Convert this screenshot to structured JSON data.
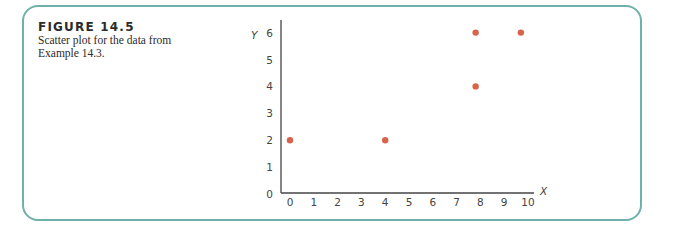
{
  "figure": {
    "title": "FIGURE 14.5",
    "caption": "Scatter plot for the data from Example 14.3.",
    "frame_color": "#6fb1aa",
    "point_color": "#d9634a"
  },
  "chart_data": {
    "type": "scatter",
    "title": "",
    "xlabel": "X",
    "ylabel": "Y",
    "xlim": [
      0,
      10
    ],
    "ylim": [
      0,
      6
    ],
    "x_ticks": [
      "0",
      "1",
      "2",
      "3",
      "4",
      "5",
      "6",
      "7",
      "8",
      "9",
      "10"
    ],
    "y_ticks": [
      "0",
      "1",
      "2",
      "3",
      "4",
      "5",
      "6"
    ],
    "grid": false,
    "legend": null,
    "series": [
      {
        "name": "Example 14.3 data",
        "points": [
          {
            "x": 0,
            "y": 2
          },
          {
            "x": 4,
            "y": 2
          },
          {
            "x": 7.8,
            "y": 4
          },
          {
            "x": 7.8,
            "y": 6
          },
          {
            "x": 9.7,
            "y": 6
          }
        ]
      }
    ]
  }
}
